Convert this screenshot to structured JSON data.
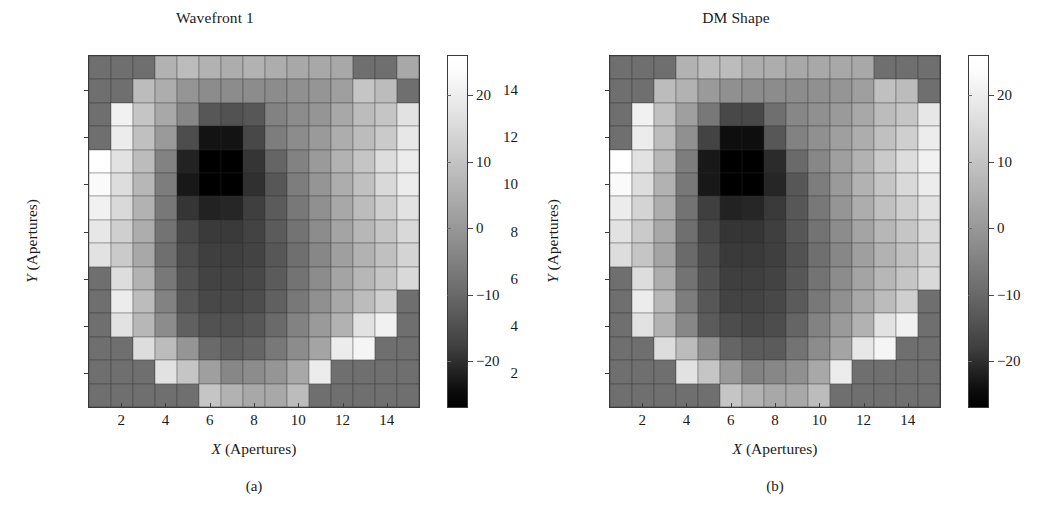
{
  "figure": {
    "panels": [
      {
        "id": "a",
        "title": "Wavefront 1",
        "subcaption": "(a)",
        "xlabel_var": "X",
        "xlabel_rest": " (Apertures)",
        "ylabel_var": "Y",
        "ylabel_rest": " (Apertures)"
      },
      {
        "id": "b",
        "title": "DM Shape",
        "subcaption": "(b)",
        "xlabel_var": "X",
        "xlabel_rest": " (Apertures)",
        "ylabel_var": "Y",
        "ylabel_rest": " (Apertures)"
      }
    ]
  },
  "chart_data": [
    {
      "type": "heatmap",
      "title": "Wavefront 1",
      "xlabel": "X (Apertures)",
      "ylabel": "Y (Apertures)",
      "xticks": [
        2,
        4,
        6,
        8,
        10,
        12,
        14
      ],
      "yticks": [
        2,
        4,
        6,
        8,
        10,
        12,
        14
      ],
      "xlim": [
        0.5,
        15.5
      ],
      "ylim": [
        0.5,
        15.5
      ],
      "grid": true,
      "colormap": "gray",
      "colorbar": {
        "ticks": [
          20,
          10,
          0,
          -10,
          -20
        ],
        "tick_labels": [
          "20",
          "10",
          "0",
          "−10",
          "−20"
        ],
        "vmin": -27,
        "vmax": 26,
        "position": "right"
      },
      "values": [
        [
          -4,
          -4,
          -4,
          10,
          12,
          10,
          9,
          10,
          9,
          8,
          8,
          8,
          -4,
          -4,
          8
        ],
        [
          -4,
          -4,
          12,
          9,
          4,
          2,
          2,
          2,
          2,
          3,
          4,
          6,
          14,
          12,
          -4
        ],
        [
          -4,
          23,
          14,
          8,
          1,
          -9,
          -10,
          -9,
          0,
          2,
          4,
          8,
          12,
          14,
          20
        ],
        [
          -4,
          22,
          13,
          5,
          -11,
          -23,
          -23,
          -12,
          -1,
          2,
          5,
          9,
          12,
          15,
          21
        ],
        [
          26,
          20,
          12,
          0,
          -20,
          -27,
          -27,
          -16,
          -6,
          0,
          5,
          10,
          14,
          19,
          22
        ],
        [
          25,
          19,
          11,
          -1,
          -22,
          -27,
          -27,
          -17,
          -9,
          -1,
          4,
          9,
          13,
          18,
          22
        ],
        [
          23,
          18,
          10,
          -2,
          -16,
          -20,
          -19,
          -14,
          -8,
          -2,
          3,
          8,
          12,
          16,
          20
        ],
        [
          21,
          16,
          9,
          -3,
          -12,
          -15,
          -15,
          -13,
          -8,
          -3,
          2,
          7,
          11,
          14,
          18
        ],
        [
          20,
          15,
          8,
          -4,
          -11,
          -14,
          -14,
          -13,
          -9,
          -4,
          1,
          6,
          10,
          13,
          17
        ],
        [
          -4,
          19,
          10,
          -2,
          -10,
          -13,
          -13,
          -12,
          -8,
          -3,
          2,
          7,
          11,
          14,
          18
        ],
        [
          -4,
          22,
          12,
          0,
          -9,
          -12,
          -12,
          -11,
          -7,
          -2,
          3,
          8,
          12,
          16,
          -4
        ],
        [
          -4,
          20,
          11,
          2,
          -7,
          -10,
          -10,
          -9,
          -5,
          0,
          5,
          10,
          20,
          23,
          -4
        ],
        [
          -4,
          -4,
          19,
          12,
          4,
          -5,
          -7,
          -6,
          -2,
          2,
          7,
          22,
          24,
          -4,
          -4
        ],
        [
          -4,
          -4,
          -4,
          20,
          14,
          6,
          1,
          2,
          4,
          8,
          22,
          -4,
          -4,
          -4,
          -4
        ],
        [
          -4,
          -4,
          -4,
          -4,
          -4,
          14,
          10,
          8,
          8,
          12,
          -4,
          -4,
          -4,
          -4,
          -4
        ]
      ]
    },
    {
      "type": "heatmap",
      "title": "DM Shape",
      "xlabel": "X (Apertures)",
      "ylabel": "Y (Apertures)",
      "xticks": [
        2,
        4,
        6,
        8,
        10,
        12,
        14
      ],
      "yticks": [
        2,
        4,
        6,
        8,
        10,
        12,
        14
      ],
      "xlim": [
        0.5,
        15.5
      ],
      "ylim": [
        0.5,
        15.5
      ],
      "grid": true,
      "colormap": "gray",
      "colorbar": {
        "ticks": [
          20,
          10,
          0,
          -10,
          -20
        ],
        "tick_labels": [
          "20",
          "10",
          "0",
          "−10",
          "−20"
        ],
        "vmin": -27,
        "vmax": 26,
        "position": "right"
      },
      "values": [
        [
          -4,
          -4,
          -4,
          10,
          12,
          12,
          9,
          9,
          8,
          8,
          8,
          8,
          -4,
          -4,
          -4
        ],
        [
          -4,
          -4,
          12,
          10,
          5,
          3,
          2,
          2,
          2,
          3,
          4,
          6,
          13,
          12,
          -4
        ],
        [
          -4,
          23,
          13,
          6,
          -2,
          -12,
          -12,
          -4,
          1,
          3,
          5,
          8,
          12,
          14,
          21
        ],
        [
          -4,
          22,
          12,
          3,
          -13,
          -24,
          -24,
          -9,
          0,
          3,
          6,
          9,
          13,
          16,
          22
        ],
        [
          26,
          20,
          11,
          -1,
          -22,
          -27,
          -27,
          -18,
          -5,
          1,
          6,
          10,
          15,
          19,
          23
        ],
        [
          25,
          19,
          10,
          -2,
          -22,
          -27,
          -27,
          -19,
          -9,
          -1,
          5,
          10,
          14,
          18,
          22
        ],
        [
          22,
          17,
          9,
          -3,
          -14,
          -20,
          -19,
          -15,
          -9,
          -2,
          4,
          9,
          13,
          16,
          20
        ],
        [
          20,
          15,
          8,
          -4,
          -12,
          -16,
          -16,
          -14,
          -9,
          -3,
          2,
          7,
          11,
          14,
          18
        ],
        [
          19,
          14,
          7,
          -5,
          -11,
          -15,
          -15,
          -14,
          -10,
          -4,
          1,
          6,
          10,
          13,
          17
        ],
        [
          -4,
          19,
          9,
          -3,
          -10,
          -14,
          -14,
          -13,
          -9,
          -3,
          2,
          7,
          11,
          14,
          18
        ],
        [
          -4,
          22,
          11,
          -1,
          -9,
          -13,
          -13,
          -12,
          -8,
          -2,
          3,
          8,
          12,
          16,
          -4
        ],
        [
          -4,
          20,
          10,
          1,
          -8,
          -11,
          -12,
          -11,
          -6,
          0,
          5,
          10,
          20,
          23,
          -4
        ],
        [
          -4,
          -4,
          19,
          12,
          3,
          -6,
          -8,
          -8,
          -3,
          2,
          7,
          21,
          24,
          -4,
          -4
        ],
        [
          -4,
          -4,
          -4,
          20,
          14,
          5,
          0,
          1,
          3,
          8,
          22,
          -4,
          -4,
          -4,
          -4
        ],
        [
          -4,
          -4,
          -4,
          -4,
          -4,
          14,
          10,
          8,
          8,
          12,
          -4,
          -4,
          -4,
          -4,
          -4
        ]
      ]
    }
  ]
}
